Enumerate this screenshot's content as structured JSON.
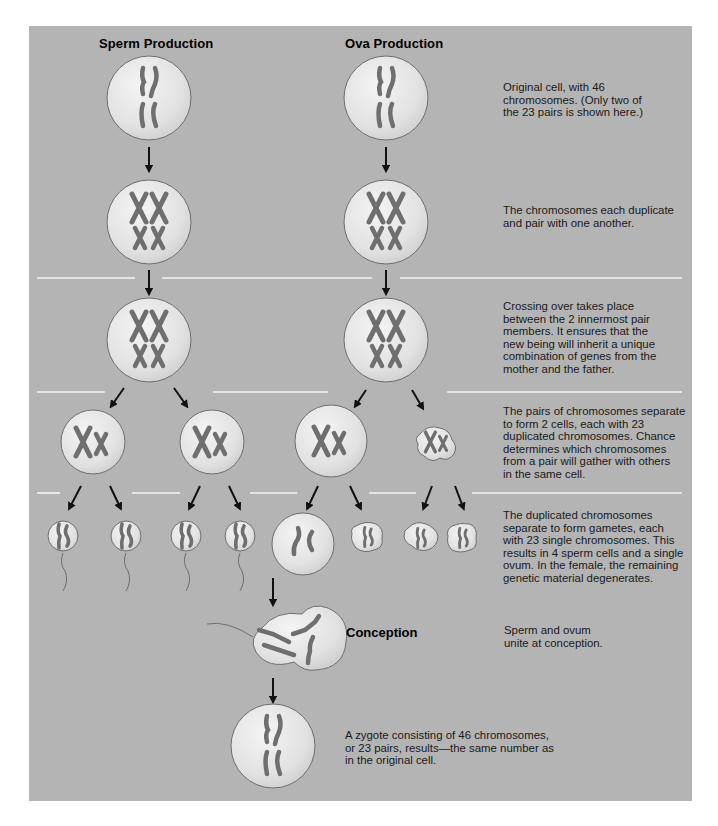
{
  "headings": {
    "sperm": "Sperm Production",
    "ova": "Ova Production",
    "conception": "Conception"
  },
  "steps": [
    {
      "id": "original",
      "text": "Original cell, with 46\nchromosomes. (Only two of\nthe 23 pairs is shown here.)"
    },
    {
      "id": "duplicate",
      "text": "The chromosomes each duplicate\nand pair with one another."
    },
    {
      "id": "crossing-over",
      "text": "Crossing over takes place\nbetween the 2 innermost pair\nmembers. It ensures that the\nnew being will inherit a unique\ncombination of genes from the\nmother and the father."
    },
    {
      "id": "separate-pairs",
      "text": "The pairs of chromosomes separate\nto form 2 cells, each with 23\nduplicated chromosomes. Chance\ndetermines which chromosomes\nfrom a pair will gather with others\nin the same cell."
    },
    {
      "id": "gametes",
      "text": "The duplicated chromosomes\nseparate to form gametes, each\nwith 23 single chromosomes. This\nresults in 4 sperm cells and a single\novum. In the female, the remaining\ngenetic material degenerates."
    },
    {
      "id": "conception",
      "text": "Sperm and ovum\nunite at conception."
    },
    {
      "id": "zygote",
      "text": "A zygote consisting of 46 chromosomes,\nor 23 pairs, results—the same number as\nin the original cell."
    }
  ],
  "colors": {
    "panel": "#b4b4b4",
    "cell_fill": "#e6e6e6",
    "cell_stroke": "#6e6e6e",
    "chromosome": "#7a7a7a",
    "arrow": "#111111",
    "divider": "#f2f2f2"
  }
}
